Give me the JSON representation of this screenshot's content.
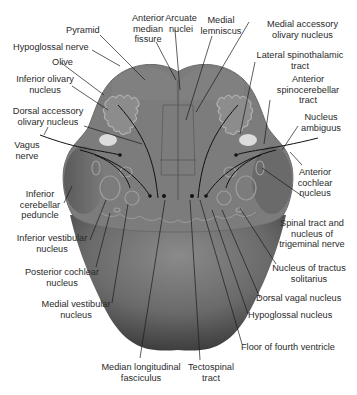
{
  "figure": {
    "colors": {
      "section_fill": "#7a7a7a",
      "section_dark": "#5e5e5e",
      "peduncle_fill": "#6a6a6a",
      "floor_dark": "#4a4a4a",
      "nuclei_outline": "#9a9a9a",
      "pale_oval": "#d8d8d8",
      "leader_line": "#1a1a1a",
      "label_text": "#2a2a2a"
    }
  },
  "labels": {
    "pyramid": "Pyramid",
    "anterior_median_fissure": [
      "Anterior",
      "median",
      "fissure"
    ],
    "arcuate_nuclei": [
      "Arcuate",
      "nuclei"
    ],
    "medial_lemniscus": [
      "Medial",
      "lemniscus"
    ],
    "medial_accessory_olivary_nucleus": [
      "Medial accessory",
      "olivary nucleus"
    ],
    "hypoglossal_nerve": "Hypoglossal nerve",
    "lateral_spinothalamic_tract": [
      "Lateral spinothalamic",
      "tract"
    ],
    "olive": "Olive",
    "anterior_spinocerebellar_tract": [
      "Anterior",
      "spinocerebellar",
      "tract"
    ],
    "inferior_olivary_nucleus": [
      "Inferior olivary",
      "nucleus"
    ],
    "nucleus_ambiguus": [
      "Nucleus",
      "ambiguus"
    ],
    "dorsal_accessory_olivary_nucleus": [
      "Dorsal accessory",
      "olivary nucleus"
    ],
    "vagus_nerve": [
      "Vagus",
      "nerve"
    ],
    "anterior_cochlear_nucleus": [
      "Anterior",
      "cochlear",
      "nucleus"
    ],
    "inferior_cerebellar_peduncle": [
      "Inferior",
      "cerebellar",
      "peduncle"
    ],
    "spinal_tract_trigeminal": [
      "Spinal tract and",
      "nucleus of",
      "trigeminal nerve"
    ],
    "inferior_vestibular_nucleus": [
      "Inferior vestibular",
      "nucleus"
    ],
    "nucleus_tractus_solitarius": [
      "Nucleus of tractus",
      "solitarius"
    ],
    "posterior_cochlear_nucleus": [
      "Posterior cochlear",
      "nucleus"
    ],
    "dorsal_vagal_nucleus": "Dorsal vagal nucleus",
    "medial_vestibular_nucleus": [
      "Medial vestibular",
      "nucleus"
    ],
    "hypoglossal_nucleus": "Hypoglossal nucleus",
    "floor_fourth_ventricle": "Floor of fourth ventricle",
    "median_longitudinal_fasciculus": [
      "Median longitudinal",
      "fasciculus"
    ],
    "tectospinal_tract": [
      "Tectospinal",
      "tract"
    ]
  }
}
